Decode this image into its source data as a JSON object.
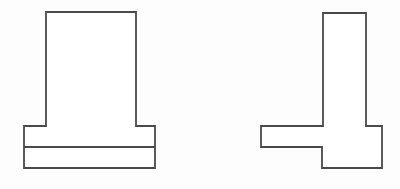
{
  "document": {
    "title": "Technical Line Drawing",
    "background_color": "#fdfdfd",
    "canvas_width": 400,
    "canvas_height": 189,
    "stroke_color": "#4a4a4a",
    "fill_color": "#ffffff",
    "stroke_width": 1.8
  },
  "figures": [
    {
      "id": "left-figure",
      "name": "T-shaped profile with two-layer base",
      "description": "Tall rectangular upright centered on a wide rectangular base divided into two horizontal bands",
      "outline_points": "46,12 136,12 136,126 155,126 155,168 24,168 24,126 46,126",
      "upright": {
        "x": 46,
        "y": 12,
        "width": 90,
        "height": 114
      },
      "base": {
        "x": 24,
        "y": 126,
        "width": 131,
        "height": 42
      },
      "divider_line": {
        "x1": 24,
        "y1": 147,
        "x2": 155,
        "y2": 147
      }
    },
    {
      "id": "right-figure",
      "name": "T-shaped profile with stepped base",
      "description": "Narrow rectangular upright on a stepped L-shaped base, thicker on the right side",
      "outline_points": "323,13 366,13 366,126 382,126 382,168 322,168 322,147 261,147 261,126 323,126",
      "upright": {
        "x": 323,
        "y": 13,
        "width": 43,
        "height": 113
      },
      "base_upper": {
        "x": 261,
        "y": 126,
        "width": 121,
        "height": 21
      },
      "base_lower": {
        "x": 322,
        "y": 147,
        "width": 60,
        "height": 21
      },
      "step_corner": {
        "x": 322,
        "y": 147
      }
    }
  ]
}
